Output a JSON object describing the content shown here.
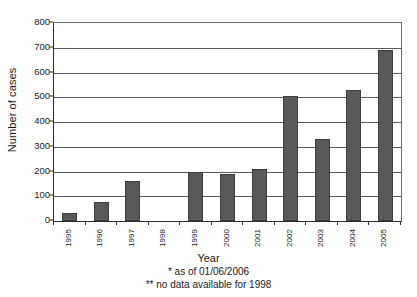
{
  "chart_data": {
    "type": "bar",
    "title": "",
    "xlabel": "Year",
    "ylabel": "Number of cases",
    "categories": [
      "1995",
      "1996",
      "1997",
      "1998",
      "1999",
      "2000",
      "2001",
      "2002",
      "2003",
      "2004",
      "2005"
    ],
    "values": [
      33,
      75,
      163,
      null,
      200,
      188,
      210,
      505,
      330,
      530,
      690
    ],
    "ylim": [
      0,
      800
    ],
    "y_ticks": [
      0,
      100,
      200,
      300,
      400,
      500,
      600,
      700,
      800
    ],
    "y_tick_labels": [
      "0",
      "100",
      "200",
      "300",
      "400",
      "500",
      "600",
      "700",
      "800"
    ],
    "grid": true,
    "legend": "none",
    "bar_color": "#595959",
    "annotations": [
      "* as of 01/06/2006",
      "** no data available for 1998"
    ]
  },
  "axes": {
    "y_title": "Number of cases",
    "x_title": "Year"
  },
  "footnotes": {
    "first": "* as of 01/06/2006",
    "second": "** no data available for 1998"
  }
}
